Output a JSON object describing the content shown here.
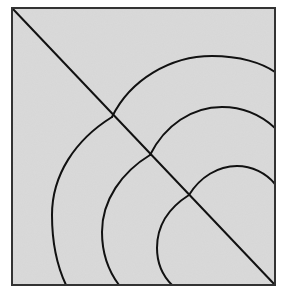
{
  "diagram": {
    "type": "geometric-line-drawing",
    "colors": {
      "fill": "#d6d6d6",
      "stroke": "#111111",
      "border": "#333333",
      "background": "#ffffff"
    },
    "square": {
      "x": 12,
      "y": 8,
      "width": 263,
      "height": 277
    },
    "diagonal": {
      "x1": 12,
      "y1": 8,
      "x2": 275,
      "y2": 285
    },
    "cusps": [
      {
        "name": "outer",
        "x": 112,
        "y": 117
      },
      {
        "name": "middle",
        "x": 150,
        "y": 155
      },
      {
        "name": "inner",
        "x": 189,
        "y": 195
      }
    ],
    "arcs": [
      {
        "name": "outer-upper",
        "d": "M112,117 C130,80 170,56 212,56 C240,56 262,63 275,72"
      },
      {
        "name": "outer-lower",
        "d": "M112,117 C75,140 52,175 52,215 C52,245 58,268 66,285"
      },
      {
        "name": "middle-upper",
        "d": "M150,155 C165,125 192,107 222,107 C245,107 262,116 275,128"
      },
      {
        "name": "middle-lower",
        "d": "M150,155 C122,172 102,200 102,232 C102,255 110,273 119,285"
      },
      {
        "name": "inner-upper",
        "d": "M189,195 C200,177 218,166 237,166 C252,166 266,173 275,184"
      },
      {
        "name": "inner-lower",
        "d": "M189,195 C170,207 157,225 157,248 C157,263 163,276 172,285"
      }
    ]
  }
}
